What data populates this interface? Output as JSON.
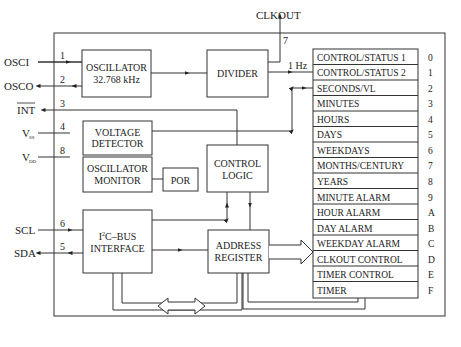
{
  "pins": {
    "osci": {
      "label": "OSCI",
      "num": "1"
    },
    "osco": {
      "label": "OSCO",
      "num": "2"
    },
    "int": {
      "label": "INT",
      "num": "3"
    },
    "vss": {
      "label": "V",
      "sub": "SS",
      "num": "4"
    },
    "vdd": {
      "label": "V",
      "sub": "DD",
      "num": "8"
    },
    "scl": {
      "label": "SCL",
      "num": "6"
    },
    "sda": {
      "label": "SDA",
      "num": "5"
    },
    "clkout": {
      "label": "CLKOUT",
      "num": "7"
    }
  },
  "blocks": {
    "oscillator": {
      "line1": "OSCILLATOR",
      "line2": "32.768 kHz"
    },
    "divider": {
      "line1": "DIVIDER"
    },
    "voltage_detector": {
      "line1": "VOLTAGE",
      "line2": "DETECTOR"
    },
    "oscillator_monitor": {
      "line1": "OSCILLATOR",
      "line2": "MONITOR"
    },
    "por": {
      "line1": "POR"
    },
    "control_logic": {
      "line1": "CONTROL",
      "line2": "LOGIC"
    },
    "i2c": {
      "line1_a": "I",
      "line1_sup": "2",
      "line1_b": "C–BUS",
      "line2": "INTERFACE"
    },
    "address_register": {
      "line1": "ADDRESS",
      "line2": "REGISTER"
    }
  },
  "signals": {
    "one_hz": "1 Hz"
  },
  "registers": [
    {
      "name": "CONTROL/STATUS 1",
      "addr": "0"
    },
    {
      "name": "CONTROL/STATUS 2",
      "addr": "1"
    },
    {
      "name": "SECONDS/VL",
      "addr": "2"
    },
    {
      "name": "MINUTES",
      "addr": "3"
    },
    {
      "name": "HOURS",
      "addr": "4"
    },
    {
      "name": "DAYS",
      "addr": "5"
    },
    {
      "name": "WEEKDAYS",
      "addr": "6"
    },
    {
      "name": "MONTHS/CENTURY",
      "addr": "7"
    },
    {
      "name": "YEARS",
      "addr": "8"
    },
    {
      "name": "MINUTE ALARM",
      "addr": "9"
    },
    {
      "name": "HOUR ALARM",
      "addr": "A"
    },
    {
      "name": "DAY ALARM",
      "addr": "B"
    },
    {
      "name": "WEEKDAY ALARM",
      "addr": "C"
    },
    {
      "name": "CLKOUT CONTROL",
      "addr": "D"
    },
    {
      "name": "TIMER CONTROL",
      "addr": "E"
    },
    {
      "name": "TIMER",
      "addr": "F"
    }
  ]
}
